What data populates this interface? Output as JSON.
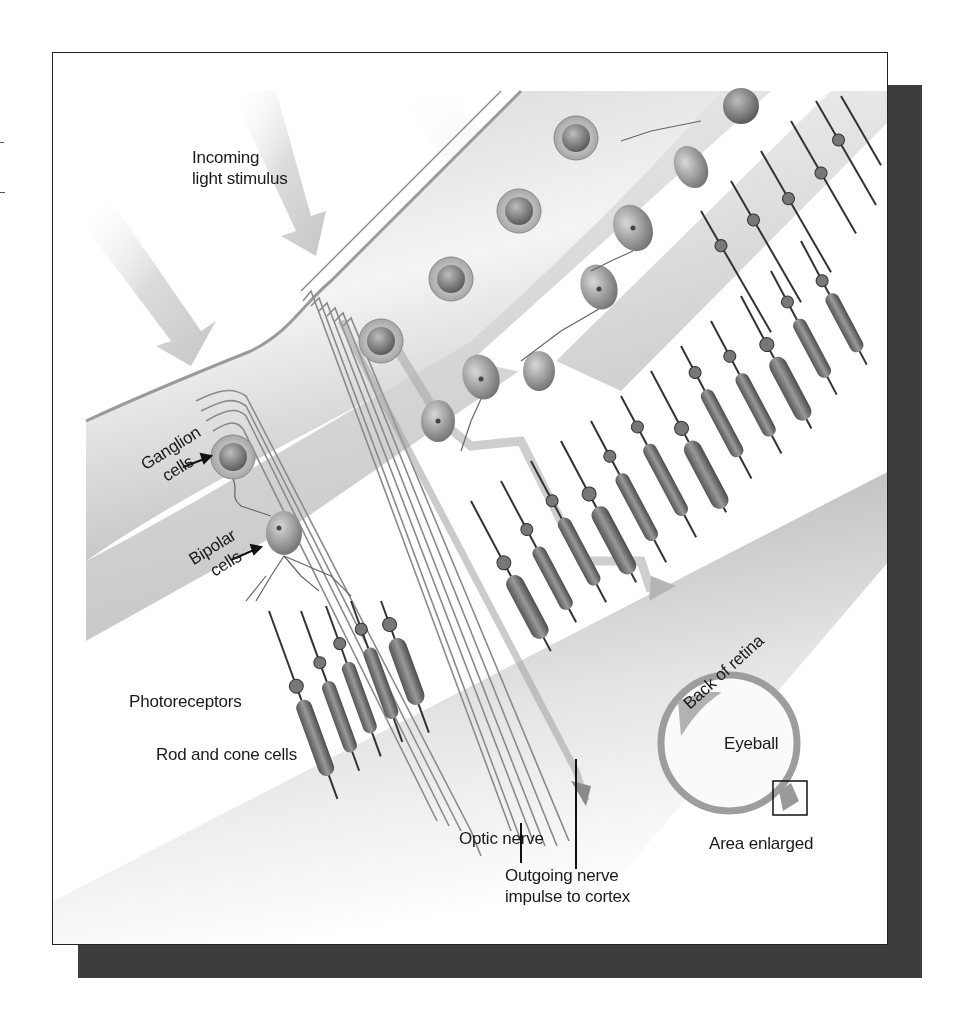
{
  "figure": {
    "type": "retina-cross-section",
    "colors": {
      "frame_border": "#222222",
      "shadow": "#3d3d3d",
      "band_light": "#f3f3f3",
      "band_dark": "#bdbdbd",
      "cell_fill": "#8a8a8a",
      "text": "#1a1a1a"
    }
  },
  "labels": {
    "incoming_light": [
      "Incoming",
      "light stimulus"
    ],
    "ganglion": [
      "Ganglion",
      "cells"
    ],
    "bipolar": [
      "Bipolar",
      "cells"
    ],
    "photoreceptors": "Photoreceptors",
    "rod_cone": "Rod and cone cells",
    "optic_nerve": "Optic nerve",
    "outgoing_impulse": [
      "Outgoing nerve",
      "impulse to cortex"
    ],
    "back_of_retina": "Back of retina",
    "eyeball": "Eyeball",
    "area_enlarged": "Area enlarged"
  }
}
